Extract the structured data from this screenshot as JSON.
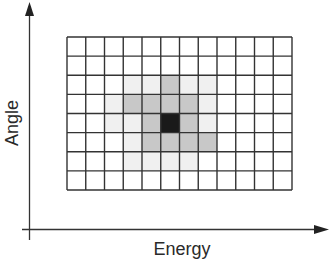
{
  "diagram": {
    "x_axis_label": "Energy",
    "y_axis_label": "Angle",
    "grid": {
      "columns": 12,
      "rows": 8,
      "left": 67,
      "top": 37,
      "right": 292,
      "bottom": 190,
      "line_color": "#333333",
      "shading_legend": {
        "0": "#ffffff",
        "1": "#f0f0f0",
        "2": "#c8c8c8",
        "3": "#1a1a1a"
      },
      "cell_shading": [
        [
          0,
          0,
          0,
          0,
          0,
          0,
          0,
          0,
          0,
          0,
          0,
          0
        ],
        [
          0,
          0,
          0,
          0,
          0,
          0,
          0,
          0,
          0,
          0,
          0,
          0
        ],
        [
          0,
          0,
          0,
          1,
          1,
          2,
          1,
          1,
          0,
          0,
          0,
          0
        ],
        [
          0,
          0,
          1,
          2,
          2,
          2,
          2,
          1,
          0,
          0,
          0,
          0
        ],
        [
          0,
          0,
          1,
          1,
          2,
          3,
          2,
          1,
          0,
          0,
          0,
          0
        ],
        [
          0,
          0,
          0,
          1,
          2,
          2,
          2,
          2,
          0,
          0,
          0,
          0
        ],
        [
          0,
          0,
          0,
          1,
          1,
          1,
          1,
          0,
          0,
          0,
          0,
          0
        ],
        [
          0,
          0,
          0,
          0,
          0,
          0,
          0,
          0,
          0,
          0,
          0,
          0
        ]
      ],
      "peak_cell": {
        "column": 5,
        "row": 4
      }
    },
    "axis_color": "#333333"
  }
}
